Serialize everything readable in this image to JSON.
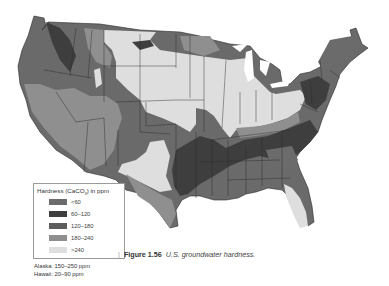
{
  "figure": {
    "number_label": "Figure 1.56",
    "caption": "U.S. groundwater hardness."
  },
  "legend": {
    "title_prefix": "Hardness (CaCO",
    "title_sub": "3",
    "title_suffix": ") in ppm",
    "items": [
      {
        "label": "<60",
        "color": "#6b6b6b"
      },
      {
        "label": "60–120",
        "color": "#3e3e3e"
      },
      {
        "label": "120–180",
        "color": "#5d5d5d"
      },
      {
        "label": "180–240",
        "color": "#8f8f8f"
      },
      {
        "label": ">240",
        "color": "#dedede"
      }
    ]
  },
  "notes": {
    "alaska": "Alaska: 150–250 ppm",
    "hawaii": "Hawaii: 20–90 ppm"
  },
  "map": {
    "subject": "Contiguous United States groundwater hardness zones",
    "border_color": "#2a2a2a"
  }
}
